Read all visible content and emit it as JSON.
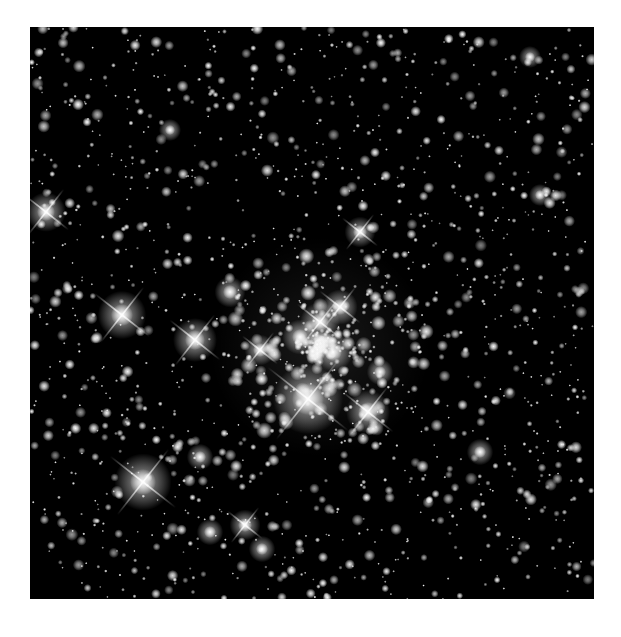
{
  "image": {
    "subject": "star cluster astronomical photograph",
    "background": "#ffffff",
    "field_color": "#000000",
    "frame": {
      "x": 30,
      "y": 27,
      "width": 564,
      "height": 572
    }
  },
  "bright_stars": [
    {
      "x": 16,
      "y": 185,
      "r": 9,
      "spikes": true
    },
    {
      "x": 92,
      "y": 288,
      "r": 11,
      "spikes": true
    },
    {
      "x": 165,
      "y": 313,
      "r": 10,
      "spikes": true
    },
    {
      "x": 113,
      "y": 455,
      "r": 13,
      "spikes": true
    },
    {
      "x": 278,
      "y": 372,
      "r": 16,
      "spikes": true
    },
    {
      "x": 338,
      "y": 385,
      "r": 10,
      "spikes": true
    },
    {
      "x": 330,
      "y": 205,
      "r": 7,
      "spikes": true
    },
    {
      "x": 290,
      "y": 295,
      "r": 9,
      "spikes": true
    },
    {
      "x": 303,
      "y": 325,
      "r": 9,
      "spikes": false
    },
    {
      "x": 270,
      "y": 310,
      "r": 8,
      "spikes": false
    },
    {
      "x": 310,
      "y": 280,
      "r": 8,
      "spikes": true
    },
    {
      "x": 230,
      "y": 323,
      "r": 7,
      "spikes": true
    },
    {
      "x": 200,
      "y": 265,
      "r": 7,
      "spikes": false
    },
    {
      "x": 450,
      "y": 425,
      "r": 6,
      "spikes": false
    },
    {
      "x": 215,
      "y": 498,
      "r": 7,
      "spikes": true
    },
    {
      "x": 180,
      "y": 505,
      "r": 6,
      "spikes": false
    },
    {
      "x": 232,
      "y": 522,
      "r": 6,
      "spikes": false
    },
    {
      "x": 510,
      "y": 168,
      "r": 5,
      "spikes": false
    },
    {
      "x": 140,
      "y": 103,
      "r": 5,
      "spikes": false
    },
    {
      "x": 500,
      "y": 30,
      "r": 5,
      "spikes": false
    },
    {
      "x": 170,
      "y": 430,
      "r": 6,
      "spikes": false
    },
    {
      "x": 350,
      "y": 345,
      "r": 6,
      "spikes": false
    }
  ],
  "faint_star_count": 1400,
  "cluster_center": {
    "x": 290,
    "y": 320,
    "radius": 110,
    "extra_stars": 260
  }
}
